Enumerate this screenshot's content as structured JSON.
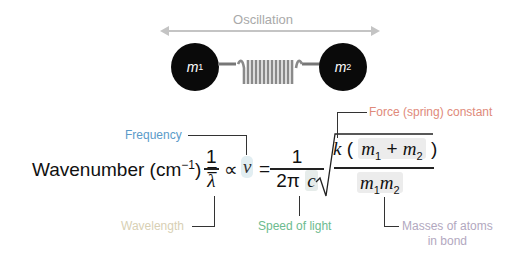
{
  "diagram": {
    "oscillation_label": "Oscillation",
    "mass1": {
      "symbol": "m",
      "sub": "1"
    },
    "mass2": {
      "symbol": "m",
      "sub": "2"
    }
  },
  "equation": {
    "lhs": "Wavenumber (cm",
    "lhs_exp": "−1",
    "lhs_close": ") =",
    "one": "1",
    "lambda": "λ",
    "propto": "∝",
    "nu": "ν",
    "equals": "=",
    "two_pi": "2π",
    "c": "c",
    "k": "k",
    "m": "m",
    "sub1": "1",
    "sub2": "2",
    "plus": "+",
    "lparen": "(",
    "rparen": ")",
    "sqrt": "√"
  },
  "labels": {
    "frequency": "Frequency",
    "wavelength": "Wavelength",
    "speed_of_light": "Speed of light",
    "force_constant": "Force (spring) constant",
    "masses_line1": "Masses of atoms",
    "masses_line2": "in bond"
  },
  "colors": {
    "frequency": "#5b9bc9",
    "wavelength": "#d8d0b4",
    "speed_of_light": "#6dbb8f",
    "force_constant": "#e08a7a",
    "masses": "#b2a8c0"
  }
}
